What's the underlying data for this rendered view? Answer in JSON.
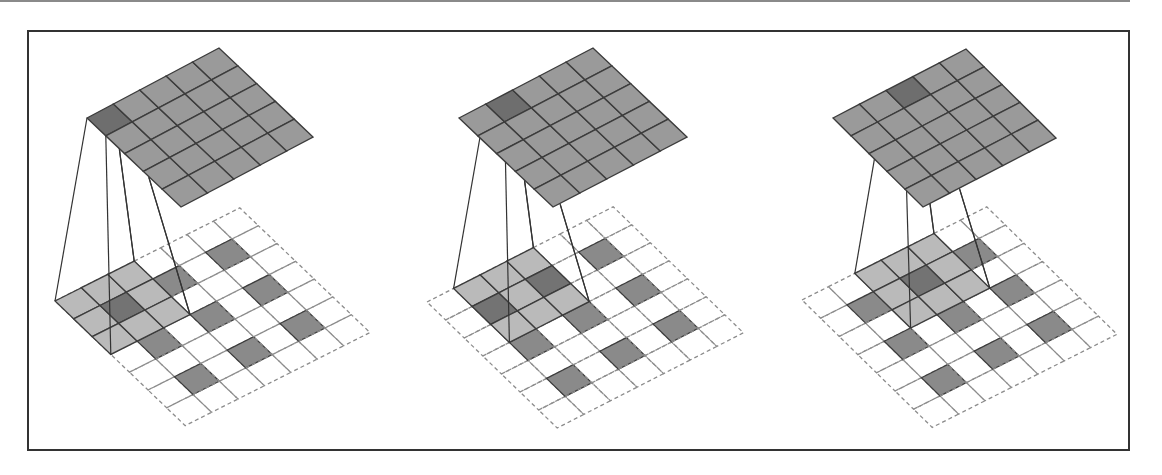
{
  "figure": {
    "colors": {
      "output_cell": "#9a9a9a",
      "output_highlight": "#6e6e6e",
      "grid_line": "#3c3c3c",
      "dashed_line": "#8c8c8c",
      "input_cell": "#8a8a8a",
      "kernel_cell": "#b4b4b4",
      "kernel_overlap": "#717171",
      "connector": "#333333",
      "frame": "#333333"
    },
    "output_size": 5,
    "input_grid_size": 7,
    "kernel_size": 3,
    "stride": 2,
    "input_cells": [
      [
        1,
        1
      ],
      [
        1,
        3
      ],
      [
        1,
        5
      ],
      [
        3,
        1
      ],
      [
        3,
        3
      ],
      [
        3,
        5
      ],
      [
        5,
        1
      ],
      [
        5,
        3
      ],
      [
        5,
        5
      ]
    ]
  },
  "panels": [
    {
      "name": "step-1",
      "output": {
        "left": [
          87,
          118
        ],
        "u": [
          26.4,
          -14.0
        ],
        "v": [
          18.8,
          17.8
        ]
      },
      "input": {
        "left": [
          55,
          301
        ],
        "u": [
          26.4,
          -13.3
        ],
        "v": [
          18.6,
          17.8
        ]
      },
      "kernel_offset": [
        0,
        0
      ],
      "highlight_output": [
        0,
        0
      ]
    },
    {
      "name": "step-2",
      "output": {
        "left": [
          459,
          118
        ],
        "u": [
          26.8,
          -14.0
        ],
        "v": [
          18.8,
          17.8
        ]
      },
      "input": {
        "left": [
          427,
          302
        ],
        "u": [
          26.6,
          -13.6
        ],
        "v": [
          18.6,
          18.0
        ]
      },
      "kernel_offset": [
        1,
        0
      ],
      "highlight_output": [
        1,
        0
      ]
    },
    {
      "name": "step-3",
      "output": {
        "left": [
          833,
          118
        ],
        "u": [
          26.6,
          -13.8
        ],
        "v": [
          18.0,
          17.8
        ]
      },
      "input": {
        "left": [
          802,
          300
        ],
        "u": [
          26.4,
          -13.3
        ],
        "v": [
          18.6,
          18.2
        ]
      },
      "kernel_offset": [
        2,
        0
      ],
      "highlight_output": [
        2,
        0
      ]
    }
  ]
}
